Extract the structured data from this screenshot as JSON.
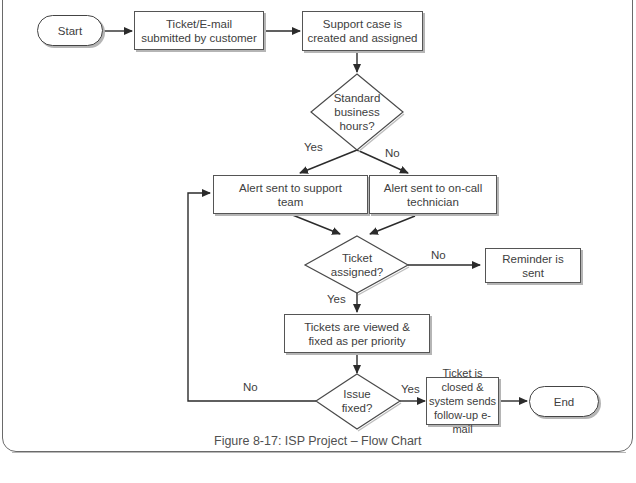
{
  "diagram": {
    "type": "flowchart",
    "nodes": {
      "start": "Start",
      "ticket_submitted": "Ticket/E-mail submitted by customer",
      "case_created": "Support case is created and assigned",
      "business_hours": "Standard business hours?",
      "alert_support": "Alert sent to support team",
      "alert_oncall": "Alert sent to on-call technician",
      "ticket_assigned": "Ticket assigned?",
      "reminder": "Reminder is sent",
      "viewed_fixed": "Tickets are viewed & fixed as per priority",
      "issue_fixed": "Issue fixed?",
      "ticket_closed": "Ticket is closed & system sends follow-up e-mail",
      "end": "End"
    },
    "edge_labels": {
      "hours_yes": "Yes",
      "hours_no": "No",
      "assigned_no": "No",
      "assigned_yes": "Yes",
      "fixed_yes": "Yes",
      "fixed_no": "No"
    },
    "colors": {
      "line": "#2b2b2b",
      "border": "#555555",
      "shadow": "#b5b5b5",
      "text": "#404040"
    }
  },
  "caption": "Figure 8-17: ISP Project – Flow Chart"
}
